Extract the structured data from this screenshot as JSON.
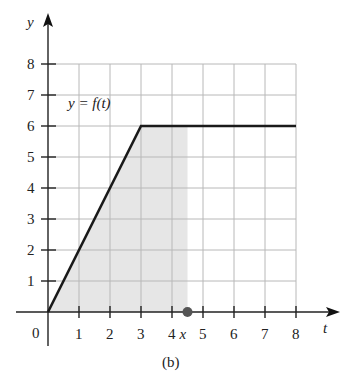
{
  "chart_data": {
    "type": "line",
    "title": "",
    "caption": "(b)",
    "function_label": "y = f(t)",
    "xlabel": "t",
    "ylabel": "y",
    "xlim": [
      0,
      8
    ],
    "ylim": [
      0,
      8
    ],
    "grid": true,
    "x_ticks": [
      "1",
      "2",
      "3",
      "4",
      "5",
      "6",
      "7",
      "8"
    ],
    "y_ticks": [
      "1",
      "2",
      "3",
      "4",
      "5",
      "6",
      "7",
      "8"
    ],
    "origin_label": "0",
    "series": [
      {
        "name": "f(t)",
        "x": [
          0,
          3,
          8
        ],
        "y": [
          0,
          6,
          6
        ]
      }
    ],
    "shaded_region": {
      "from": 0,
      "to": 4.5,
      "under": "f(t)"
    },
    "annotations": [
      {
        "label": "x",
        "x": 4.5,
        "y": 0,
        "marker": "dot"
      }
    ]
  },
  "colors": {
    "line": "#1a1a1a",
    "grid": "#b8b8b8",
    "shade": "#e6e6e6",
    "dot": "#555555"
  }
}
